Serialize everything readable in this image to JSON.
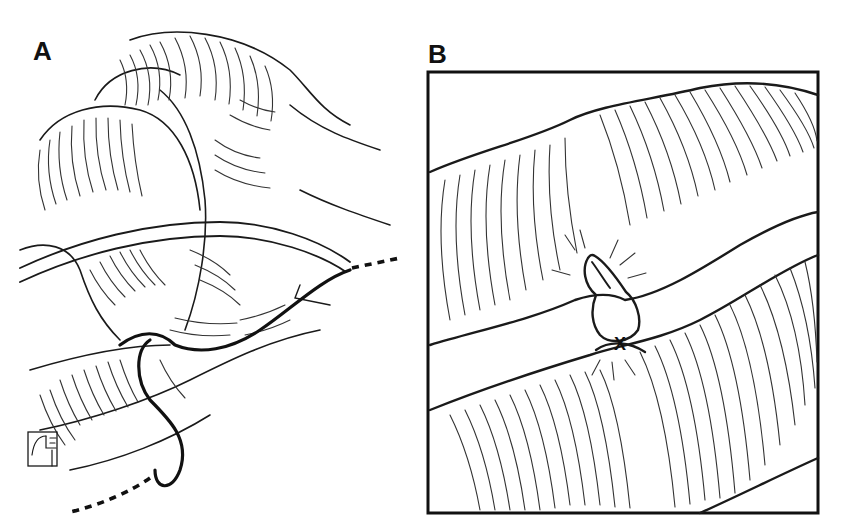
{
  "figure": {
    "panels": [
      {
        "label": "A",
        "description": "Loops of intestine with a drainage tube passing across and a suture thread (solid, with dashed ends) looping between bowel segments",
        "elements": [
          "bowel-loops",
          "drain-tube",
          "suture-thread",
          "artist-monogram"
        ]
      },
      {
        "label": "B",
        "description": "Boxed close-up of two bowel segments joined at a tied knot (X) with a small everted nipple of tissue",
        "elements": [
          "upper-bowel-segment",
          "lower-bowel-segment",
          "knot",
          "frame-border"
        ]
      }
    ],
    "knot_mark": "X",
    "colors": {
      "ink": "#111111",
      "background": "#ffffff"
    }
  }
}
